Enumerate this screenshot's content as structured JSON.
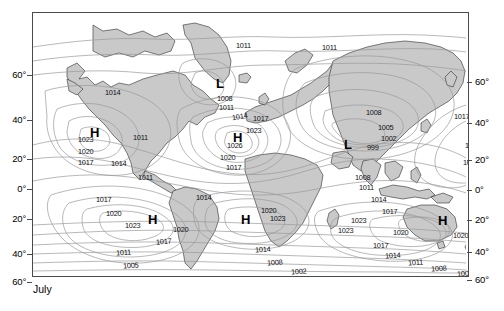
{
  "figure": {
    "caption": "July",
    "map_type": "world-sea-level-pressure-map",
    "units": "hPa"
  },
  "axes": {
    "left_ticks": [
      {
        "label": "60°",
        "y": 63
      },
      {
        "label": "40°",
        "y": 108
      },
      {
        "label": "20°",
        "y": 147
      },
      {
        "label": "0°",
        "y": 177
      },
      {
        "label": "20°",
        "y": 207
      },
      {
        "label": "40°",
        "y": 242
      },
      {
        "label": "60°",
        "y": 270
      }
    ],
    "right_ticks": [
      {
        "label": "60°",
        "y": 70
      },
      {
        "label": "40°",
        "y": 111
      },
      {
        "label": "20°",
        "y": 148
      },
      {
        "label": "0°",
        "y": 178
      },
      {
        "label": "20°",
        "y": 208
      },
      {
        "label": "40°",
        "y": 240
      },
      {
        "label": "60°",
        "y": 268
      }
    ]
  },
  "chart_data": {
    "type": "contour-map",
    "title": "July",
    "xlabel": "",
    "ylabel": "Latitude",
    "variable": "Mean sea-level pressure",
    "units": "hPa",
    "contour_interval": 3,
    "contour_levels": [
      999,
      1002,
      1005,
      1008,
      1011,
      1014,
      1017,
      1020,
      1023,
      1026
    ],
    "pressure_centers": [
      {
        "kind": "H",
        "name": "north-pacific-high",
        "value": 1023,
        "x": 62,
        "y": 120
      },
      {
        "kind": "H",
        "name": "azores-high",
        "value": 1026,
        "x": 205,
        "y": 125
      },
      {
        "kind": "L",
        "name": "icelandic-low",
        "value": 1008,
        "x": 188,
        "y": 71
      },
      {
        "kind": "L",
        "name": "asian-monsoon-low",
        "value": 999,
        "x": 316,
        "y": 132
      },
      {
        "kind": "H",
        "name": "south-pacific-high",
        "value": 1023,
        "x": 120,
        "y": 207
      },
      {
        "kind": "H",
        "name": "south-atlantic-high",
        "value": 1023,
        "x": 213,
        "y": 207
      },
      {
        "kind": "H",
        "name": "australian-high",
        "value": 1020,
        "x": 410,
        "y": 208
      }
    ],
    "isobar_labels": [
      {
        "text": "1011",
        "x": 203,
        "y": 28,
        "rot": 0
      },
      {
        "text": "1011",
        "x": 289,
        "y": 30,
        "rot": 0
      },
      {
        "text": "1014",
        "x": 72,
        "y": 75,
        "rot": 0
      },
      {
        "text": "1008",
        "x": 184,
        "y": 81,
        "rot": 0
      },
      {
        "text": "1011",
        "x": 186,
        "y": 90,
        "rot": 0
      },
      {
        "text": "1014",
        "x": 199,
        "y": 99,
        "rot": -10
      },
      {
        "text": "1017",
        "x": 220,
        "y": 101,
        "rot": 0
      },
      {
        "text": "1008",
        "x": 333,
        "y": 95,
        "rot": 0
      },
      {
        "text": "1005",
        "x": 345,
        "y": 110,
        "rot": 0
      },
      {
        "text": "1023",
        "x": 213,
        "y": 113,
        "rot": 0
      },
      {
        "text": "1026",
        "x": 194,
        "y": 128,
        "rot": 0
      },
      {
        "text": "1002",
        "x": 348,
        "y": 121,
        "rot": 0
      },
      {
        "text": "999",
        "x": 334,
        "y": 130,
        "rot": 0
      },
      {
        "text": "1023",
        "x": 45,
        "y": 122,
        "rot": 0
      },
      {
        "text": "1020",
        "x": 45,
        "y": 134,
        "rot": 0
      },
      {
        "text": "1017",
        "x": 45,
        "y": 145,
        "rot": 0
      },
      {
        "text": "1011",
        "x": 100,
        "y": 120,
        "rot": 0
      },
      {
        "text": "1020",
        "x": 187,
        "y": 140,
        "rot": 0
      },
      {
        "text": "1017",
        "x": 193,
        "y": 150,
        "rot": 0
      },
      {
        "text": "1017",
        "x": 421,
        "y": 99,
        "rot": 0
      },
      {
        "text": "1014",
        "x": 432,
        "y": 128,
        "rot": 0
      },
      {
        "text": "1011",
        "x": 430,
        "y": 145,
        "rot": 0
      },
      {
        "text": "1014",
        "x": 78,
        "y": 146,
        "rot": 0
      },
      {
        "text": "1011",
        "x": 105,
        "y": 160,
        "rot": 0
      },
      {
        "text": "1014",
        "x": 163,
        "y": 180,
        "rot": 0
      },
      {
        "text": "1008",
        "x": 322,
        "y": 160,
        "rot": 0
      },
      {
        "text": "1011",
        "x": 326,
        "y": 170,
        "rot": 0
      },
      {
        "text": "1014",
        "x": 338,
        "y": 182,
        "rot": 0
      },
      {
        "text": "1017",
        "x": 349,
        "y": 194,
        "rot": 0
      },
      {
        "text": "1017",
        "x": 63,
        "y": 182,
        "rot": 0
      },
      {
        "text": "1020",
        "x": 73,
        "y": 196,
        "rot": 0
      },
      {
        "text": "1023",
        "x": 92,
        "y": 208,
        "rot": 0
      },
      {
        "text": "1020",
        "x": 140,
        "y": 212,
        "rot": 0
      },
      {
        "text": "1017",
        "x": 123,
        "y": 224,
        "rot": -5
      },
      {
        "text": "1020",
        "x": 228,
        "y": 193,
        "rot": 0
      },
      {
        "text": "1023",
        "x": 237,
        "y": 201,
        "rot": 0
      },
      {
        "text": "1023",
        "x": 318,
        "y": 203,
        "rot": 0
      },
      {
        "text": "1023",
        "x": 305,
        "y": 213,
        "rot": 0
      },
      {
        "text": "1020",
        "x": 360,
        "y": 215,
        "rot": 0
      },
      {
        "text": "1020",
        "x": 420,
        "y": 218,
        "rot": 0
      },
      {
        "text": "1017",
        "x": 340,
        "y": 228,
        "rot": 0
      },
      {
        "text": "1014",
        "x": 222,
        "y": 232,
        "rot": -4
      },
      {
        "text": "1014",
        "x": 352,
        "y": 238,
        "rot": -4
      },
      {
        "text": "1011",
        "x": 375,
        "y": 245,
        "rot": -4
      },
      {
        "text": "1008",
        "x": 234,
        "y": 245,
        "rot": -4
      },
      {
        "text": "1008",
        "x": 398,
        "y": 251,
        "rot": -4
      },
      {
        "text": "1002",
        "x": 258,
        "y": 254,
        "rot": -4
      },
      {
        "text": "1002",
        "x": 424,
        "y": 256,
        "rot": -4
      },
      {
        "text": "1011",
        "x": 83,
        "y": 235,
        "rot": -4
      },
      {
        "text": "1005",
        "x": 90,
        "y": 248,
        "rot": -4
      },
      {
        "text": "999",
        "x": 85,
        "y": 266,
        "rot": -4
      },
      {
        "text": "1005",
        "x": 412,
        "y": 262,
        "rot": -4
      },
      {
        "text": "999",
        "x": 410,
        "y": 269,
        "rot": -4
      }
    ]
  },
  "colors": {
    "land_fill": "#c9c9c9",
    "land_stroke": "#2b2b2b",
    "isobar_stroke": "#9a9a9a",
    "frame_stroke": "#4a4a4a",
    "background": "#ffffff",
    "text": "#111111"
  }
}
